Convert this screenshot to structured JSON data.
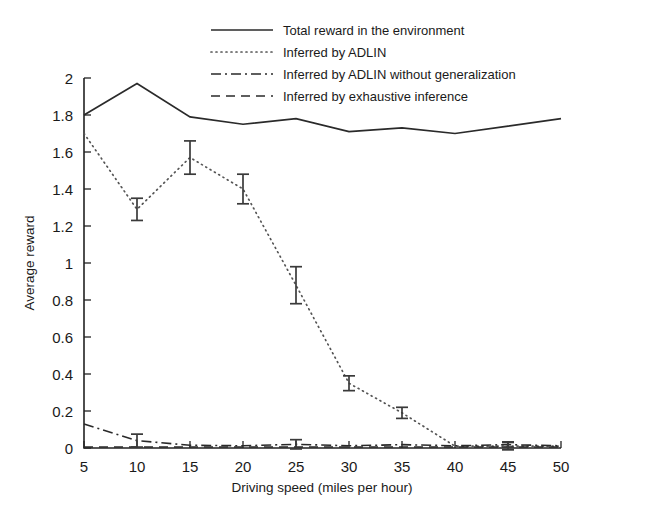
{
  "chart_data": {
    "type": "line",
    "title": "",
    "xlabel": "Driving speed (miles per hour)",
    "ylabel": "Average reward",
    "xlim": [
      5,
      50
    ],
    "ylim": [
      0,
      2
    ],
    "grid": false,
    "legend_position": "top-right",
    "x": [
      5,
      10,
      15,
      20,
      25,
      30,
      35,
      40,
      45,
      50
    ],
    "xticks": [
      "5",
      "10",
      "15",
      "20",
      "25",
      "30",
      "35",
      "40",
      "45",
      "50"
    ],
    "yticks": [
      "0",
      "0.2",
      "0.4",
      "0.6",
      "0.8",
      "1",
      "1.2",
      "1.4",
      "1.6",
      "1.8",
      "2"
    ],
    "series": [
      {
        "name": "Total reward in the environment",
        "style": "solid",
        "values": [
          1.8,
          1.97,
          1.79,
          1.75,
          1.78,
          1.71,
          1.73,
          1.7,
          1.74,
          1.78
        ],
        "errors": [
          0,
          0,
          0,
          0,
          0,
          0,
          0,
          0,
          0,
          0
        ]
      },
      {
        "name": "Inferred by ADLIN",
        "style": "dotted",
        "values": [
          1.7,
          1.29,
          1.57,
          1.4,
          0.88,
          0.35,
          0.19,
          0.01,
          0.01,
          0.01
        ],
        "errors": [
          0,
          0.06,
          0.09,
          0.08,
          0.1,
          0.04,
          0.03,
          0,
          0.02,
          0
        ]
      },
      {
        "name": "Inferred by ADLIN without generalization",
        "style": "dash-dot",
        "values": [
          0.13,
          0.04,
          0.015,
          0.012,
          0.02,
          0.012,
          0.018,
          0.012,
          0.018,
          0.012
        ],
        "errors": [
          0,
          0.035,
          0,
          0,
          0.025,
          0,
          0,
          0,
          0.015,
          0
        ]
      },
      {
        "name": "Inferred by exhaustive inference",
        "style": "dashed",
        "values": [
          0.005,
          0.005,
          0.005,
          0.005,
          0.005,
          0.005,
          0.005,
          0.005,
          0.005,
          0.005
        ],
        "errors": [
          0,
          0,
          0,
          0,
          0,
          0,
          0,
          0,
          0,
          0
        ]
      }
    ]
  },
  "legend": {
    "items": [
      {
        "label": "Total reward in the environment",
        "style": "solid"
      },
      {
        "label": "Inferred by ADLIN",
        "style": "dotted"
      },
      {
        "label": "Inferred by ADLIN without generalization",
        "style": "dash-dot"
      },
      {
        "label": "Inferred by exhaustive inference",
        "style": "dashed"
      }
    ]
  },
  "axes": {
    "x_title": "Driving speed (miles per hour)",
    "y_title": "Average reward"
  }
}
